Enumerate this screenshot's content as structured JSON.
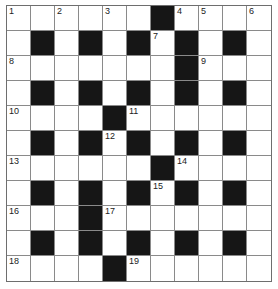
{
  "puzzle": {
    "rows": 11,
    "cols": 11,
    "colors": {
      "block": "#161616",
      "cell": "#ffffff",
      "line": "#8a8a8a"
    },
    "layout": [
      "WWWWWWBWWWW",
      "WBWBWBWBWBW",
      "WWWWWWWBWWW",
      "WBWBWBWBWBW",
      "WWWWBWWWWWW",
      "WBWBWBWBWBW",
      "WWWWWWBWWWW",
      "WBWBWBWBWBW",
      "WWWBWWWWWWW",
      "WBWBWBWBWBW",
      "WWWWBWWWWWW"
    ],
    "numbers": [
      {
        "row": 0,
        "col": 0,
        "n": "1"
      },
      {
        "row": 0,
        "col": 2,
        "n": "2"
      },
      {
        "row": 0,
        "col": 4,
        "n": "3"
      },
      {
        "row": 0,
        "col": 7,
        "n": "4"
      },
      {
        "row": 0,
        "col": 8,
        "n": "5"
      },
      {
        "row": 0,
        "col": 10,
        "n": "6"
      },
      {
        "row": 1,
        "col": 6,
        "n": "7"
      },
      {
        "row": 2,
        "col": 0,
        "n": "8"
      },
      {
        "row": 2,
        "col": 8,
        "n": "9"
      },
      {
        "row": 4,
        "col": 0,
        "n": "10"
      },
      {
        "row": 4,
        "col": 5,
        "n": "11"
      },
      {
        "row": 5,
        "col": 4,
        "n": "12"
      },
      {
        "row": 6,
        "col": 0,
        "n": "13"
      },
      {
        "row": 6,
        "col": 7,
        "n": "14"
      },
      {
        "row": 7,
        "col": 6,
        "n": "15"
      },
      {
        "row": 8,
        "col": 0,
        "n": "16"
      },
      {
        "row": 8,
        "col": 4,
        "n": "17"
      },
      {
        "row": 10,
        "col": 0,
        "n": "18"
      },
      {
        "row": 10,
        "col": 5,
        "n": "19"
      }
    ]
  }
}
